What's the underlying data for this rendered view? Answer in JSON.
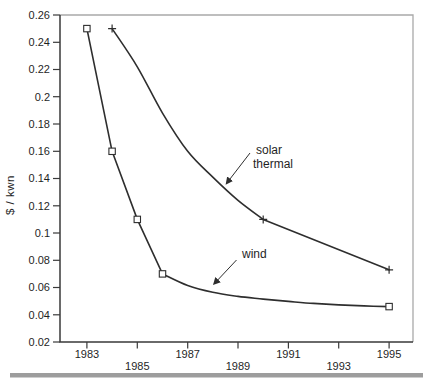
{
  "chart_data": {
    "type": "line",
    "title": "",
    "xlabel": "",
    "ylabel": "$ / kwn",
    "grid": "off",
    "frame": "box",
    "legend": "none (curves labeled with arrows)",
    "xlim": [
      1981.93,
      1995.95
    ],
    "ylim": [
      0.02,
      0.26
    ],
    "x_tick_labels": [
      "1983",
      "1985",
      "1987",
      "1989",
      "1991",
      "1993",
      "1995"
    ],
    "x_tick_values": [
      1983,
      1985,
      1987,
      1989,
      1991,
      1993,
      1995
    ],
    "x_tick_stagger": [
      "upper",
      "lower",
      "upper",
      "lower",
      "upper",
      "lower",
      "upper"
    ],
    "y_tick_labels": [
      "0.26",
      "0.24",
      "0.22",
      "0.2",
      "0.18",
      "0.16",
      "0.14",
      "0.12",
      "0.1",
      "0.08",
      "0.06",
      "0.04",
      "0.02"
    ],
    "y_tick_values": [
      0.26,
      0.24,
      0.22,
      0.2,
      0.18,
      0.16,
      0.14,
      0.12,
      0.1,
      0.08,
      0.06,
      0.04,
      0.02
    ],
    "series": [
      {
        "name": "wind",
        "slug": "wind",
        "marker": "square",
        "points": [
          [
            1983,
            0.25
          ],
          [
            1984,
            0.16
          ],
          [
            1985,
            0.11
          ],
          [
            1986,
            0.07
          ],
          [
            1995,
            0.046
          ]
        ],
        "segments": [
          {
            "type": "line",
            "pts": [
              [
                1983,
                0.25
              ],
              [
                1984,
                0.16
              ],
              [
                1985,
                0.11
              ],
              [
                1986,
                0.07
              ]
            ]
          },
          {
            "type": "smooth",
            "pts": [
              [
                1986,
                0.07
              ],
              [
                1987,
                0.0615
              ],
              [
                1988,
                0.0565
              ],
              [
                1989,
                0.0535
              ],
              [
                1990,
                0.0515
              ],
              [
                1991,
                0.0498
              ],
              [
                1992,
                0.0483
              ],
              [
                1993,
                0.0472
              ],
              [
                1994,
                0.0465
              ],
              [
                1995,
                0.046
              ]
            ]
          }
        ]
      },
      {
        "name": "solar thermal",
        "slug": "solar-thermal",
        "marker": "plus",
        "points": [
          [
            1984,
            0.25
          ],
          [
            1990,
            0.11
          ],
          [
            1995,
            0.073
          ]
        ],
        "segments": [
          {
            "type": "smooth",
            "pts": [
              [
                1984,
                0.25
              ],
              [
                1985,
                0.222
              ],
              [
                1986,
                0.188
              ],
              [
                1987,
                0.16
              ],
              [
                1988,
                0.141
              ],
              [
                1989,
                0.124
              ],
              [
                1990,
                0.11
              ]
            ]
          },
          {
            "type": "line",
            "pts": [
              [
                1990,
                0.11
              ],
              [
                1995,
                0.073
              ]
            ]
          }
        ]
      }
    ],
    "annotations": [
      {
        "slug": "solar-thermal",
        "lines": [
          "solar",
          "thermal"
        ],
        "text_px": [
          [
            256,
            153.5
          ],
          [
            253,
            167.5
          ]
        ],
        "arrow_px": [
          250,
          153,
          226.5,
          183.5
        ]
      },
      {
        "slug": "wind",
        "lines": [
          "wind"
        ],
        "text_px": [
          [
            242,
            257.5
          ]
        ],
        "arrow_px": [
          236.5,
          260,
          214,
          284
        ]
      }
    ],
    "colors": {
      "background": "#ffffff",
      "curve": "#2e2e2e",
      "axis_dark": "#3a3a3a",
      "frame_light": "#a9a9a9",
      "text": "#1f1f1f",
      "bottom_bar": "#9d9d9d"
    }
  }
}
